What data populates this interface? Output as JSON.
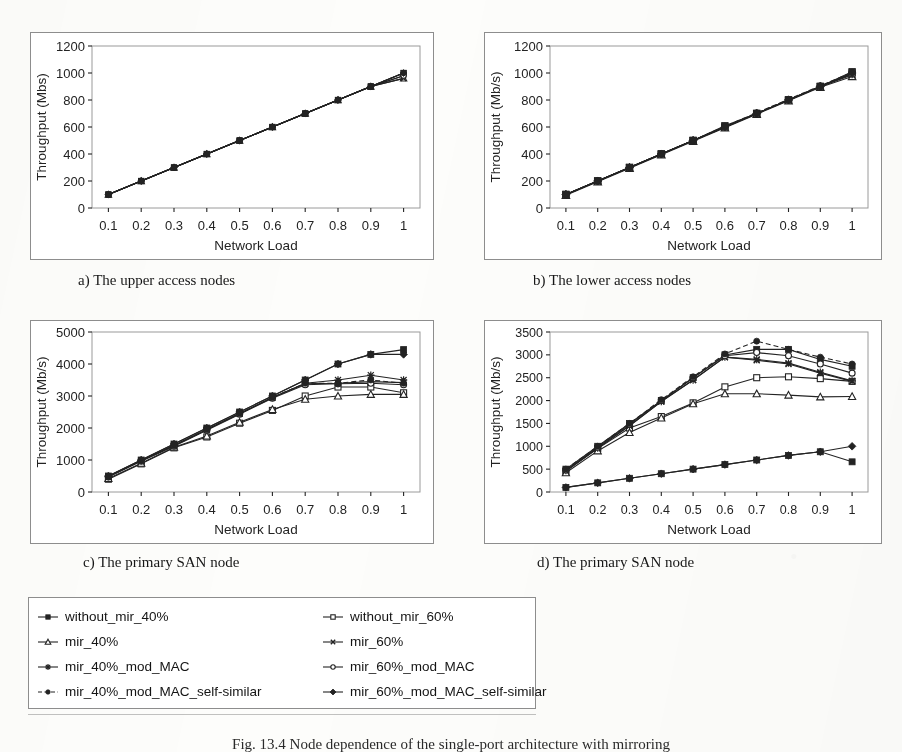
{
  "figure": {
    "caption": "Fig. 13.4 Node dependence of the single-port architecture with mirroring"
  },
  "axis": {
    "xlabel": "Network Load",
    "xticks": [
      "0.1",
      "0.2",
      "0.3",
      "0.4",
      "0.5",
      "0.6",
      "0.7",
      "0.8",
      "0.9",
      "1"
    ]
  },
  "panels": [
    {
      "id": "a",
      "caption": "a) The upper access nodes"
    },
    {
      "id": "b",
      "caption": "b) The lower access nodes"
    },
    {
      "id": "c",
      "caption": "c) The primary SAN node"
    },
    {
      "id": "d",
      "caption": "d) The primary SAN node"
    }
  ],
  "legend": {
    "items": [
      {
        "label": "without_mir_40%",
        "marker": "square-filled",
        "dash": "solid"
      },
      {
        "label": "without_mir_60%",
        "marker": "square-open",
        "dash": "solid"
      },
      {
        "label": "mir_40%",
        "marker": "triangle-open",
        "dash": "solid"
      },
      {
        "label": "mir_60%",
        "marker": "x-cross",
        "dash": "solid"
      },
      {
        "label": "mir_40%_mod_MAC",
        "marker": "asterisk",
        "dash": "solid"
      },
      {
        "label": "mir_60%_mod_MAC",
        "marker": "circle-open",
        "dash": "solid"
      },
      {
        "label": "mir_40%_mod_MAC_self-similar",
        "marker": "circle-filled",
        "dash": "dashed"
      },
      {
        "label": "mir_60%_mod_MAC_self-similar",
        "marker": "diamond-filled",
        "dash": "solid"
      }
    ]
  },
  "chart_data": [
    {
      "id": "a",
      "type": "line",
      "title": "a) The upper access nodes",
      "xlabel": "Network Load",
      "ylabel": "Throughput (Mbs)",
      "x": [
        0.1,
        0.2,
        0.3,
        0.4,
        0.5,
        0.6,
        0.7,
        0.8,
        0.9,
        1
      ],
      "xlim": [
        0.05,
        1.05
      ],
      "ylim": [
        0,
        1200
      ],
      "yticks": [
        0,
        200,
        400,
        600,
        800,
        1000,
        1200
      ],
      "grid": false,
      "legend_position": "external-shared",
      "series": [
        {
          "name": "without_mir_40%",
          "marker": "square-filled",
          "values": [
            100,
            200,
            300,
            400,
            500,
            600,
            700,
            800,
            900,
            1000
          ]
        },
        {
          "name": "without_mir_60%",
          "marker": "square-open",
          "values": [
            100,
            200,
            300,
            400,
            500,
            600,
            700,
            800,
            900,
            1000
          ]
        },
        {
          "name": "mir_40%",
          "marker": "triangle-open",
          "values": [
            100,
            200,
            300,
            400,
            500,
            600,
            700,
            800,
            900,
            960
          ]
        },
        {
          "name": "mir_60%",
          "marker": "x-cross",
          "values": [
            100,
            200,
            300,
            400,
            500,
            600,
            700,
            800,
            900,
            960
          ]
        },
        {
          "name": "mir_40%_mod_MAC",
          "marker": "asterisk",
          "values": [
            100,
            200,
            300,
            400,
            500,
            600,
            700,
            800,
            900,
            980
          ]
        },
        {
          "name": "mir_60%_mod_MAC",
          "marker": "circle-open",
          "values": [
            100,
            200,
            300,
            400,
            500,
            600,
            700,
            800,
            900,
            980
          ]
        },
        {
          "name": "mir_40%_mod_MAC_self-similar",
          "marker": "circle-filled",
          "values": [
            100,
            200,
            300,
            400,
            500,
            600,
            700,
            800,
            900,
            1000
          ]
        },
        {
          "name": "mir_60%_mod_MAC_self-similar",
          "marker": "diamond-filled",
          "values": [
            100,
            200,
            300,
            400,
            500,
            600,
            700,
            800,
            900,
            1000
          ]
        }
      ]
    },
    {
      "id": "b",
      "type": "line",
      "title": "b) The lower access nodes",
      "xlabel": "Network Load",
      "ylabel": "Throughput (Mb/s)",
      "x": [
        0.1,
        0.2,
        0.3,
        0.4,
        0.5,
        0.6,
        0.7,
        0.8,
        0.9,
        1
      ],
      "xlim": [
        0.05,
        1.05
      ],
      "ylim": [
        0,
        1200
      ],
      "yticks": [
        0,
        200,
        400,
        600,
        800,
        1000,
        1200
      ],
      "grid": false,
      "legend_position": "external-shared",
      "series": [
        {
          "name": "without_mir_40%",
          "marker": "square-filled",
          "values": [
            100,
            200,
            300,
            400,
            500,
            610,
            700,
            800,
            900,
            1010
          ]
        },
        {
          "name": "without_mir_60%",
          "marker": "square-open",
          "values": [
            100,
            200,
            300,
            400,
            500,
            600,
            700,
            800,
            900,
            1000
          ]
        },
        {
          "name": "mir_40%",
          "marker": "triangle-open",
          "values": [
            95,
            195,
            295,
            395,
            495,
            595,
            695,
            795,
            895,
            975
          ]
        },
        {
          "name": "mir_60%",
          "marker": "x-cross",
          "values": [
            100,
            200,
            300,
            400,
            500,
            600,
            700,
            800,
            900,
            985
          ]
        },
        {
          "name": "mir_40%_mod_MAC",
          "marker": "asterisk",
          "values": [
            100,
            200,
            300,
            400,
            500,
            600,
            700,
            800,
            900,
            990
          ]
        },
        {
          "name": "mir_60%_mod_MAC",
          "marker": "circle-open",
          "values": [
            100,
            200,
            300,
            400,
            500,
            600,
            700,
            800,
            900,
            995
          ]
        },
        {
          "name": "mir_40%_mod_MAC_self-similar",
          "marker": "circle-filled",
          "values": [
            100,
            200,
            300,
            400,
            500,
            605,
            705,
            805,
            905,
            1005
          ]
        },
        {
          "name": "mir_60%_mod_MAC_self-similar",
          "marker": "diamond-filled",
          "values": [
            100,
            200,
            300,
            400,
            500,
            600,
            700,
            800,
            900,
            1000
          ]
        }
      ]
    },
    {
      "id": "c",
      "type": "line",
      "title": "c) The primary SAN node",
      "xlabel": "Network Load",
      "ylabel": "Throughput (Mb/s)",
      "x": [
        0.1,
        0.2,
        0.3,
        0.4,
        0.5,
        0.6,
        0.7,
        0.8,
        0.9,
        1
      ],
      "xlim": [
        0.05,
        1.05
      ],
      "ylim": [
        0,
        5000
      ],
      "yticks": [
        0,
        1000,
        2000,
        3000,
        4000,
        5000
      ],
      "grid": false,
      "legend_position": "external-shared",
      "series": [
        {
          "name": "without_mir_40%",
          "marker": "square-filled",
          "values": [
            500,
            1000,
            1500,
            2000,
            2500,
            3000,
            3500,
            4000,
            4300,
            4450
          ]
        },
        {
          "name": "without_mir_60%",
          "marker": "square-open",
          "values": [
            400,
            880,
            1380,
            1720,
            2150,
            2550,
            3000,
            3280,
            3280,
            3100
          ]
        },
        {
          "name": "mir_40%",
          "marker": "triangle-open",
          "values": [
            420,
            900,
            1400,
            1750,
            2180,
            2580,
            2900,
            3000,
            3050,
            3050
          ]
        },
        {
          "name": "mir_60%",
          "marker": "x-cross",
          "values": [
            480,
            980,
            1450,
            1950,
            2450,
            2950,
            3380,
            3400,
            3450,
            3420
          ]
        },
        {
          "name": "mir_40%_mod_MAC",
          "marker": "asterisk",
          "values": [
            480,
            980,
            1450,
            1950,
            2450,
            2950,
            3400,
            3500,
            3650,
            3500
          ]
        },
        {
          "name": "mir_60%_mod_MAC",
          "marker": "circle-open",
          "values": [
            470,
            960,
            1430,
            1930,
            2430,
            2930,
            3350,
            3380,
            3400,
            3350
          ]
        },
        {
          "name": "mir_40%_mod_MAC_self-similar",
          "marker": "circle-filled",
          "values": [
            480,
            980,
            1450,
            1950,
            2450,
            2950,
            3400,
            3400,
            3500,
            3400
          ]
        },
        {
          "name": "mir_60%_mod_MAC_self-similar",
          "marker": "diamond-filled",
          "values": [
            500,
            1000,
            1500,
            2000,
            2500,
            3000,
            3500,
            4000,
            4300,
            4300
          ]
        }
      ]
    },
    {
      "id": "d",
      "type": "line",
      "title": "d) The primary SAN node",
      "xlabel": "Network Load",
      "ylabel": "Throughput (Mb/s)",
      "x": [
        0.1,
        0.2,
        0.3,
        0.4,
        0.5,
        0.6,
        0.7,
        0.8,
        0.9,
        1
      ],
      "xlim": [
        0.05,
        1.05
      ],
      "ylim": [
        0,
        3500
      ],
      "yticks": [
        0,
        500,
        1000,
        1500,
        2000,
        2500,
        3000,
        3500
      ],
      "grid": false,
      "legend_position": "external-shared",
      "series": [
        {
          "name": "without_mir_40%",
          "marker": "square-filled",
          "values": [
            500,
            1000,
            1500,
            2000,
            2500,
            3000,
            3120,
            3120,
            2900,
            2750
          ]
        },
        {
          "name": "without_mir_60%",
          "marker": "square-open",
          "values": [
            450,
            950,
            1400,
            1650,
            1950,
            2300,
            2500,
            2520,
            2480,
            2420
          ]
        },
        {
          "name": "mir_40%",
          "marker": "triangle-open",
          "values": [
            420,
            900,
            1300,
            1620,
            1930,
            2150,
            2150,
            2120,
            2080,
            2090
          ]
        },
        {
          "name": "mir_60%",
          "marker": "x-cross",
          "values": [
            470,
            960,
            1450,
            1980,
            2450,
            2950,
            2880,
            2800,
            2600,
            2420
          ]
        },
        {
          "name": "mir_40%_mod_MAC",
          "marker": "asterisk",
          "values": [
            470,
            960,
            1450,
            1980,
            2450,
            2950,
            2900,
            2820,
            2620,
            2430
          ]
        },
        {
          "name": "mir_60%_mod_MAC",
          "marker": "circle-open",
          "values": [
            480,
            980,
            1480,
            2000,
            2500,
            2980,
            3050,
            2980,
            2800,
            2600
          ]
        },
        {
          "name": "mir_40%_mod_MAC_self-similar",
          "marker": "circle-filled",
          "values": [
            500,
            1000,
            1500,
            2020,
            2520,
            3020,
            3300,
            3120,
            2950,
            2800
          ]
        },
        {
          "name": "mir_60%_mod_MAC_self-similar",
          "marker": "diamond-filled",
          "values": [
            100,
            200,
            300,
            400,
            500,
            600,
            700,
            800,
            880,
            1000
          ]
        },
        {
          "name": "mir_low_square",
          "marker": "square-filled",
          "values": [
            100,
            200,
            300,
            400,
            500,
            600,
            700,
            800,
            880,
            660
          ]
        }
      ]
    }
  ]
}
